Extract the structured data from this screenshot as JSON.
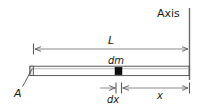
{
  "figure": {
    "kind": "physics-diagram",
    "background_color": "#ffffff",
    "ink_color": "#1a1a1a",
    "line_color": "#6b6b6b",
    "mass_element_color": "#000000",
    "labels": {
      "axis": "Axis",
      "length": "L",
      "mass_element": "dm",
      "rod_end": "A",
      "width_element": "dx",
      "distance": "x"
    },
    "geometry": {
      "axis_line": {
        "x": 189,
        "y_top": 8,
        "y_bottom": 80
      },
      "length_dimension": {
        "x_start": 33,
        "x_end": 189,
        "y": 49
      },
      "rod": {
        "x_left": 30,
        "x_right": 189,
        "y_top": 66,
        "y_bottom": 76
      },
      "mass_element_block": {
        "x": 115,
        "y": 67,
        "width": 7,
        "height": 8
      },
      "dx_dimension": {
        "x_start": 116,
        "x_end": 121,
        "y": 88
      },
      "x_dimension": {
        "x_start": 121,
        "x_end": 189,
        "y": 88
      },
      "leader_A": {
        "x_start": 22,
        "y_start": 86,
        "x_end": 33,
        "y_end": 68
      }
    }
  }
}
